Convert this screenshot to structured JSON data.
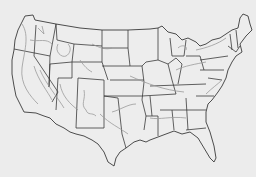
{
  "map": {
    "title": "",
    "type": "outline map",
    "region": "Contiguous United States",
    "features": [
      "state boundaries",
      "relief contour lines"
    ],
    "colors": {
      "background": "#ececec",
      "land": "#ededed",
      "boundary": "#3a3a3a",
      "contour": "#9a9a9a"
    },
    "labels": []
  }
}
